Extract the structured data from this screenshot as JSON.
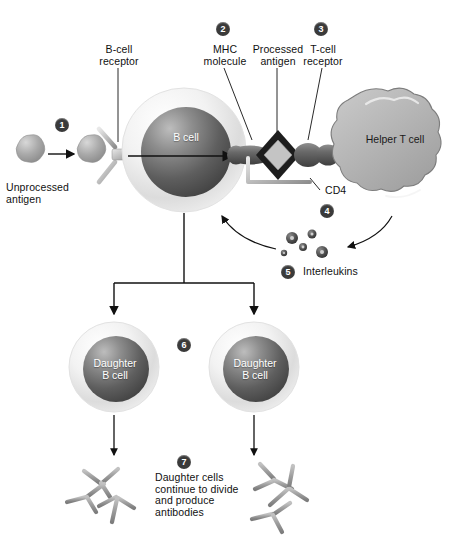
{
  "diagram": {
    "background": "#ffffff",
    "ink": "#111111",
    "badge_color": "#3a3a3a",
    "cell_text_color": "#ffffff",
    "membrane_color": "#d9d9d9",
    "nucleus_color": "#555555",
    "antibody_color": "#9a9a9a",
    "tcell_color": "#b0b0b0"
  },
  "labels": {
    "unprocessed_antigen": "Unprocessed\nantigen",
    "bcell_receptor": "B-cell\nreceptor",
    "mhc_molecule": "MHC\nmolecule",
    "processed_antigen": "Processed\nantigen",
    "tcell_receptor": "T-cell\nreceptor",
    "cd4": "CD4",
    "interleukins": "Interleukins",
    "daughter_note": "Daughter cells\ncontinue to divide\nand produce\nantibodies"
  },
  "cells": {
    "b_cell": "B cell",
    "helper_t_cell": "Helper T cell",
    "daughter_left": "Daughter\nB cell",
    "daughter_right": "Daughter\nB cell"
  },
  "steps": [
    {
      "n": "1",
      "label": "Unprocessed antigen binds B-cell receptor"
    },
    {
      "n": "2",
      "label": "MHC molecule presents processed antigen"
    },
    {
      "n": "3",
      "label": "T-cell receptor binds antigen-MHC complex"
    },
    {
      "n": "4",
      "label": "CD4 co-receptor engagement"
    },
    {
      "n": "5",
      "label": "Interleukins released by helper T cell"
    },
    {
      "n": "6",
      "label": "B cell divides into daughter B cells"
    },
    {
      "n": "7",
      "label": "Daughter cells divide and produce antibodies"
    }
  ]
}
